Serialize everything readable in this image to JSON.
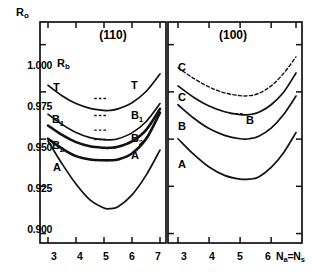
{
  "figure": {
    "y_axis_label": "R",
    "y_axis_label_sub": "o",
    "x_axis_label": "N",
    "x_axis_label_sub1": "a",
    "x_axis_label_mid": "=N",
    "x_axis_label_sub2": "s",
    "reference_label": "R",
    "reference_label_sub": "b",
    "reference_value": "1.000"
  },
  "axes": {
    "y_ticks": [
      "1.000",
      "0.975",
      "0.950",
      "0.925",
      "0.900"
    ],
    "y_values": [
      1.0,
      0.975,
      0.95,
      0.925,
      0.9
    ],
    "x_ticks": [
      "3",
      "4",
      "5",
      "6",
      "7"
    ],
    "x_values": [
      3,
      4,
      5,
      6,
      7
    ],
    "ylim": [
      0.895,
      1.012
    ],
    "xlim_left": [
      2.8,
      7.2
    ],
    "xlim_right": [
      2.8,
      6.9
    ]
  },
  "panels": [
    {
      "title": "(110)",
      "left_labels": [
        "T",
        "B",
        "B",
        "A"
      ]
    },
    {
      "title": "(100)",
      "left_labels": [
        "C",
        "C",
        "B",
        "A"
      ]
    }
  ],
  "chart_data": {
    "type": "line",
    "title": "",
    "xlabel": "Na=Ns",
    "ylabel": "Ro",
    "ylim": [
      0.895,
      1.012
    ],
    "grid": false,
    "legend": "in-plot curve labels",
    "panels": [
      {
        "name": "(110)",
        "xlim": [
          3,
          7
        ],
        "x": [
          3,
          3.5,
          4,
          4.5,
          5,
          5.2,
          5.5,
          6,
          6.5,
          7
        ],
        "series": [
          {
            "name": "T",
            "label": "T",
            "style": "solid",
            "values": [
              0.9785,
              0.973,
              0.9688,
              0.9663,
              0.9652,
              0.9652,
              0.966,
              0.9692,
              0.9752,
              0.9845
            ]
          },
          {
            "name": "B1",
            "label": "B1",
            "style": "solid",
            "values": [
              0.9632,
              0.9578,
              0.9535,
              0.9508,
              0.9497,
              0.9496,
              0.9502,
              0.9533,
              0.9592,
              0.9688
            ]
          },
          {
            "name": "B2",
            "label": "B2",
            "style": "solid",
            "values": [
              0.9572,
              0.9522,
              0.9484,
              0.9462,
              0.9454,
              0.9454,
              0.9459,
              0.9488,
              0.9548,
              0.966
            ]
          },
          {
            "name": "A",
            "label": "A",
            "style": "solid",
            "values": [
              0.9502,
              0.945,
              0.941,
              0.9392,
              0.9388,
              0.9388,
              0.9392,
              0.9424,
              0.95,
              0.964
            ]
          },
          {
            "name": "lowest",
            "label": "",
            "style": "solid",
            "values": [
              0.949,
              0.937,
              0.9262,
              0.9178,
              0.9135,
              0.9132,
              0.9142,
              0.9205,
              0.9308,
              0.9442
            ]
          }
        ],
        "inplot_keys": [
          {
            "label": "T",
            "x": 5.15,
            "y": 0.9715,
            "dash": true
          },
          {
            "label": "B1",
            "x": 5.15,
            "y": 0.9625,
            "dash": true
          },
          {
            "label": "B2",
            "x": 5.15,
            "y": 0.9548,
            "dash": true
          },
          {
            "label": "A",
            "x": 5.15,
            "y": 0.9498,
            "dash": true
          }
        ]
      },
      {
        "name": "(100)",
        "xlim": [
          3,
          6.8
        ],
        "x": [
          3,
          3.5,
          4,
          4.5,
          5,
          5.3,
          5.6,
          6,
          6.4,
          6.8
        ],
        "series": [
          {
            "name": "C-dashed",
            "label": "C",
            "style": "dashed",
            "values": [
              0.9878,
              0.9822,
              0.9776,
              0.9745,
              0.973,
              0.973,
              0.9742,
              0.9782,
              0.9848,
              0.9935
            ]
          },
          {
            "name": "C-solid",
            "label": "C",
            "style": "solid",
            "values": [
              0.9782,
              0.9722,
              0.9675,
              0.9645,
              0.963,
              0.963,
              0.9642,
              0.9682,
              0.9748,
              0.985
            ]
          },
          {
            "name": "B",
            "label": "B",
            "style": "solid",
            "values": [
              0.9682,
              0.9612,
              0.9556,
              0.952,
              0.9502,
              0.9502,
              0.9515,
              0.9558,
              0.963,
              0.9728
            ]
          },
          {
            "name": "A",
            "label": "A",
            "style": "solid",
            "values": [
              0.9502,
              0.942,
              0.9352,
              0.9308,
              0.9288,
              0.9288,
              0.93,
              0.935,
              0.9428,
              0.9535
            ]
          }
        ],
        "inplot_keys": [
          {
            "label": "B",
            "x": 5.15,
            "y": 0.9635,
            "dash": true
          }
        ]
      }
    ]
  }
}
